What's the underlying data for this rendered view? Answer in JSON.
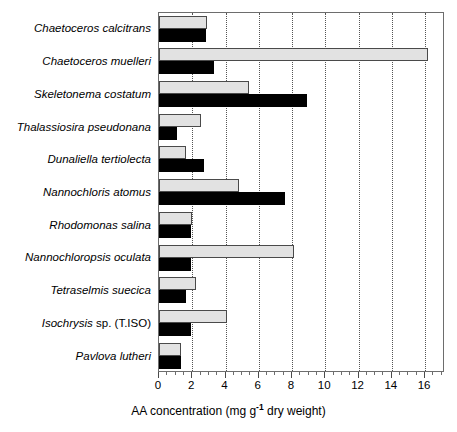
{
  "chart_data": {
    "type": "bar",
    "orientation": "horizontal",
    "title": "",
    "xlabel": "AA concentration  (mg g-1 dry weight)",
    "ylabel": "",
    "xlim": [
      0,
      17.2
    ],
    "xticks": [
      0,
      2,
      4,
      6,
      8,
      10,
      12,
      14,
      16
    ],
    "xtick_labels": [
      "0",
      "2",
      "4",
      "6",
      "8",
      "10",
      "12",
      "14",
      "16"
    ],
    "grid": "vertical dotted gridlines at major x ticks",
    "legend": "none",
    "categories": [
      "Chaetoceros calcitrans",
      "Chaetoceros muelleri",
      "Skeletonema costatum",
      "Thalassiosira pseudonana",
      "Dunaliella tertiolecta",
      "Nannochloris atomus",
      "Rhodomonas salina",
      "Nannochloropsis oculata",
      "Tetraselmis suecica",
      "Isochrysis sp. (T.ISO)",
      "Pavlova lutheri"
    ],
    "series": [
      {
        "name": "grey",
        "color": "#e2e2e2",
        "values": [
          2.9,
          16.2,
          5.4,
          2.5,
          1.6,
          4.8,
          2.0,
          8.1,
          2.2,
          4.1,
          1.3
        ]
      },
      {
        "name": "black",
        "color": "#000000",
        "values": [
          2.8,
          3.3,
          8.9,
          1.1,
          2.7,
          7.6,
          1.9,
          1.9,
          1.6,
          1.9,
          1.3
        ]
      }
    ]
  },
  "labels": {
    "axis_title_main": "AA concentration  (mg g",
    "axis_title_sup": "-1",
    "axis_title_tail": " dry weight)"
  },
  "categories_display": [
    {
      "italic": "Chaetoceros calcitrans",
      "upright": ""
    },
    {
      "italic": "Chaetoceros muelleri",
      "upright": ""
    },
    {
      "italic": "Skeletonema costatum",
      "upright": ""
    },
    {
      "italic": "Thalassiosira pseudonana",
      "upright": ""
    },
    {
      "italic": "Dunaliella tertiolecta",
      "upright": ""
    },
    {
      "italic": "Nannochloris atomus",
      "upright": ""
    },
    {
      "italic": "Rhodomonas salina",
      "upright": ""
    },
    {
      "italic": "Nannochloropsis oculata",
      "upright": ""
    },
    {
      "italic": "Tetraselmis suecica",
      "upright": ""
    },
    {
      "italic": "Isochrysis ",
      "upright": "sp. (T.ISO)"
    },
    {
      "italic": "Pavlova lutheri",
      "upright": ""
    }
  ]
}
